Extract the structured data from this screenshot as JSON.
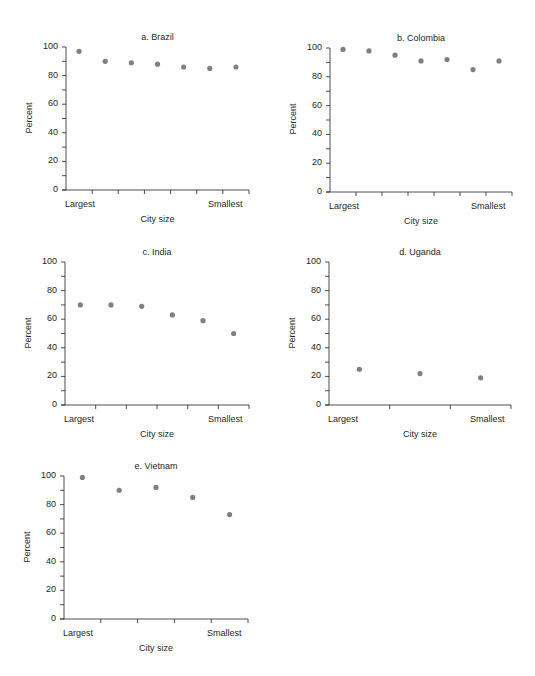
{
  "chart_data": [
    {
      "type": "scatter",
      "title": "a. Brazil",
      "xlabel": "City size",
      "ylabel": "Percent",
      "x_end_labels": [
        "Largest",
        "Smallest"
      ],
      "yticks": [
        0,
        20,
        40,
        60,
        80,
        100
      ],
      "ylim": [
        0,
        100
      ],
      "categories": [
        1,
        2,
        3,
        4,
        5,
        6,
        7
      ],
      "values": [
        97,
        90,
        89,
        88,
        86,
        85,
        86
      ],
      "grid": false
    },
    {
      "type": "scatter",
      "title": "b. Colombia",
      "xlabel": "City size",
      "ylabel": "Percent",
      "x_end_labels": [
        "Largest",
        "Smallest"
      ],
      "yticks": [
        0,
        20,
        40,
        60,
        80,
        100
      ],
      "ylim": [
        0,
        100
      ],
      "categories": [
        1,
        2,
        3,
        4,
        5,
        6,
        7
      ],
      "values": [
        99,
        98,
        95,
        91,
        92,
        85,
        91
      ],
      "grid": false
    },
    {
      "type": "scatter",
      "title": "c. India",
      "xlabel": "City size",
      "ylabel": "Percent",
      "x_end_labels": [
        "Largest",
        "Smallest"
      ],
      "yticks": [
        0,
        20,
        40,
        60,
        80,
        100
      ],
      "ylim": [
        0,
        100
      ],
      "categories": [
        1,
        2,
        3,
        4,
        5,
        6
      ],
      "values": [
        70,
        70,
        69,
        63,
        59,
        50
      ],
      "grid": false
    },
    {
      "type": "scatter",
      "title": "d. Uganda",
      "xlabel": "City size",
      "ylabel": "Percent",
      "x_end_labels": [
        "Largest",
        "Smallest"
      ],
      "yticks": [
        0,
        20,
        40,
        60,
        80,
        100
      ],
      "ylim": [
        0,
        100
      ],
      "categories": [
        1,
        2,
        3
      ],
      "values": [
        25,
        22,
        19
      ],
      "grid": false
    },
    {
      "type": "scatter",
      "title": "e. Vietnam",
      "xlabel": "City size",
      "ylabel": "Percent",
      "x_end_labels": [
        "Largest",
        "Smallest"
      ],
      "yticks": [
        0,
        20,
        40,
        60,
        80,
        100
      ],
      "ylim": [
        0,
        100
      ],
      "categories": [
        1,
        2,
        3,
        4,
        5
      ],
      "values": [
        99,
        90,
        92,
        85,
        73
      ],
      "grid": false
    }
  ],
  "colors": {
    "marker": "#808080",
    "axis": "#231f20"
  },
  "layout": [
    {
      "x0": 66,
      "x1": 249,
      "y0": 190,
      "y100": 47,
      "title_y": 5
    },
    {
      "x0": 330,
      "x1": 512,
      "y0": 192,
      "y100": 48,
      "title_y": 5
    },
    {
      "x0": 65,
      "x1": 249,
      "y0": 405,
      "y100": 262,
      "title_y": 240
    },
    {
      "x0": 329,
      "x1": 511,
      "y0": 405,
      "y100": 262,
      "title_y": 240
    },
    {
      "x0": 64,
      "x1": 248,
      "y0": 619,
      "y100": 476,
      "title_y": 455
    }
  ]
}
